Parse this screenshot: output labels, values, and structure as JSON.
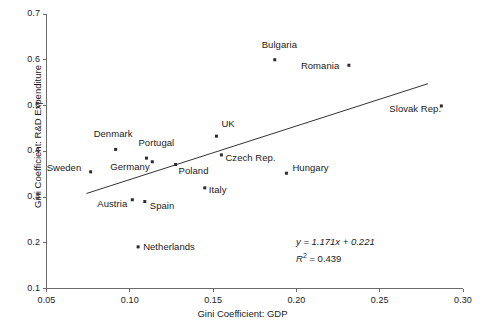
{
  "chart_data": {
    "type": "scatter",
    "title": "",
    "xlabel": "Gini Coefficient: GDP",
    "ylabel": "Gini Coefficient: R&D Expenditure",
    "xlim": [
      0.05,
      0.3
    ],
    "ylim": [
      0.1,
      0.7
    ],
    "xticks": [
      "0.05",
      "0.10",
      "0.15",
      "0.20",
      "0.25",
      "0.30"
    ],
    "xtick_values": [
      0.05,
      0.1,
      0.15,
      0.2,
      0.25,
      0.3
    ],
    "yticks": [
      "0.1",
      "0.2",
      "0.3",
      "0.4",
      "0.5",
      "0.6",
      "0.7"
    ],
    "ytick_values": [
      0.1,
      0.2,
      0.3,
      0.4,
      0.5,
      0.6,
      0.7
    ],
    "grid": false,
    "legend": "none",
    "points": [
      {
        "label": "Sweden",
        "x": 0.0765,
        "y": 0.355,
        "label_dx": -44,
        "label_dy": -4
      },
      {
        "label": "Denmark",
        "x": 0.0915,
        "y": 0.404,
        "label_dx": -22,
        "label_dy": -15
      },
      {
        "label": "Austria",
        "x": 0.1015,
        "y": 0.294,
        "label_dx": -35,
        "label_dy": 4
      },
      {
        "label": "Netherlands",
        "x": 0.105,
        "y": 0.191,
        "label_dx": 5,
        "label_dy": 0
      },
      {
        "label": "Spain",
        "x": 0.109,
        "y": 0.29,
        "label_dx": 5,
        "label_dy": 4
      },
      {
        "label": "Portugal",
        "x": 0.11,
        "y": 0.385,
        "label_dx": -8,
        "label_dy": -15
      },
      {
        "label": "Germany",
        "x": 0.1135,
        "y": 0.377,
        "label_dx": -42,
        "label_dy": 5
      },
      {
        "label": "Poland",
        "x": 0.1275,
        "y": 0.371,
        "label_dx": 3,
        "label_dy": 6
      },
      {
        "label": "Italy",
        "x": 0.145,
        "y": 0.32,
        "label_dx": 4,
        "label_dy": 2
      },
      {
        "label": "UK",
        "x": 0.152,
        "y": 0.433,
        "label_dx": 5,
        "label_dy": -12
      },
      {
        "label": "Czech Rep.",
        "x": 0.155,
        "y": 0.392,
        "label_dx": 4,
        "label_dy": 3
      },
      {
        "label": "Bulgaria",
        "x": 0.187,
        "y": 0.6,
        "label_dx": -13,
        "label_dy": -15
      },
      {
        "label": "Hungary",
        "x": 0.194,
        "y": 0.352,
        "label_dx": 6,
        "label_dy": -5
      },
      {
        "label": "Romania",
        "x": 0.2315,
        "y": 0.588,
        "label_dx": -48,
        "label_dy": 1
      },
      {
        "label": "Slovak Rep.",
        "x": 0.287,
        "y": 0.499,
        "label_dx": -52,
        "label_dy": 3
      }
    ],
    "trendline": {
      "slope": 1.171,
      "intercept": 0.221,
      "x_start": 0.074,
      "x_end": 0.279,
      "equation": "y = 1.171x + 0.221",
      "r_squared_label": "R",
      "r_squared_exp": "2",
      "r_squared_value": "= 0.439"
    }
  }
}
